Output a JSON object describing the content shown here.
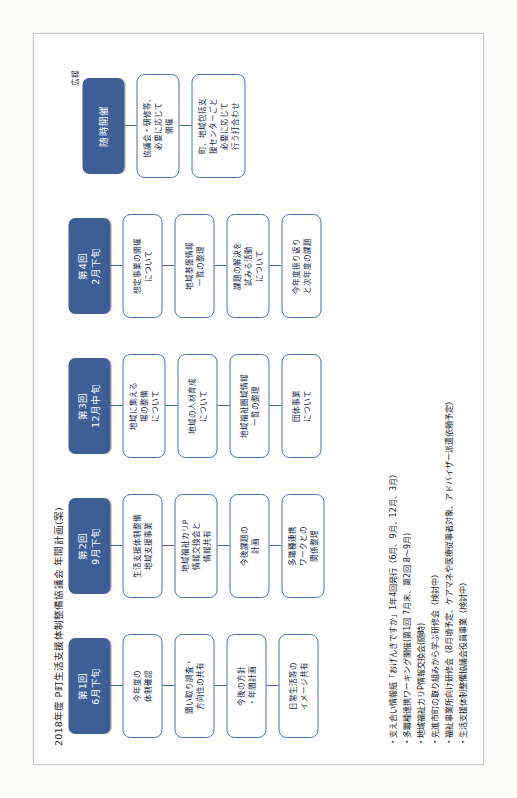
{
  "document": {
    "title": "2018年度 P町生活支援体制整備協議会 年間計画(案)",
    "brand_color": "#3d5f96",
    "node_border_color": "#4c6ea8"
  },
  "columns": [
    {
      "header_num": "第1回",
      "header_when": "6月下旬",
      "note": "",
      "nodes": [
        "今年度の\n体制確認",
        "聞い取り調査・\n方向性の共有",
        "今後の方針\n・年間計画",
        "日常生活等の\nイメージ共有"
      ]
    },
    {
      "header_num": "第2回",
      "header_when": "9月下旬",
      "note": "",
      "nodes": [
        "生活支援体制整備\n地域支援事業",
        "地域福祉カリP\n情報交換会と\n情報共有",
        "今後課題の\n計画",
        "多職種連携\nワークとの\n関係整理"
      ]
    },
    {
      "header_num": "第3回",
      "header_when": "12月中旬",
      "note": "",
      "nodes": [
        "地域に集える\n場の整備\nについて",
        "地域の人材育成\nについて",
        "地域福祉圏域情報\n一覧の整理",
        "団体事業\nについて"
      ]
    },
    {
      "header_num": "第4回",
      "header_when": "2月下旬",
      "note": "",
      "nodes": [
        "想定事業の開催\nについて",
        "地域基盤情報\n一覧の整理",
        "課題の解決を\n試みる活動\nについて",
        "今年度振り返り\nと次年度の課題"
      ]
    },
    {
      "header_num": "",
      "header_when": "随時開催",
      "note": "広報",
      "nodes": [
        "協議会・研修等、\n必要に応じて\n開催",
        "町、地域包括支\n援センターごと\n必要に応じて\n行う打合わせ"
      ]
    }
  ],
  "bullets": [
    "・支え合い情報紙「おげんきですか」1年4回発行（6月、9月、12月、3月）",
    "・多職種連携ワーキング開催(第1回 7月末、第2回 8～9月)",
    "・地域福祉カリP情報交換会(随時)",
    "・先進市町の取り組みから学ぶ研修会（検討中）",
    "・福祉事業所向け研修会（8月頃予定、ケアマネや医療従事者対象、アドバイザー派遣依頼予定）",
    "・生活支援体制整備協議会役員事業（検討中）"
  ]
}
